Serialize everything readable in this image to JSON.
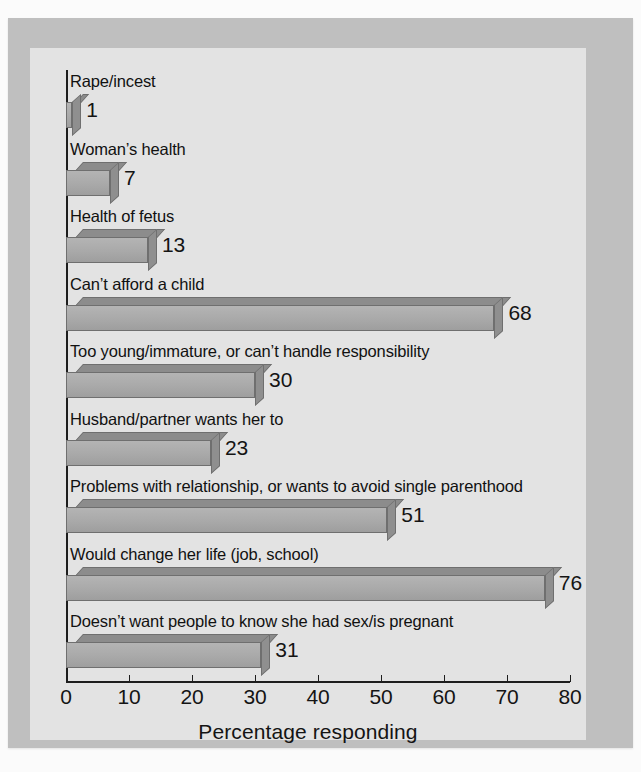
{
  "chart_data": {
    "type": "bar",
    "orientation": "horizontal",
    "title": "",
    "xlabel": "Percentage responding",
    "ylabel": "",
    "xlim": [
      0,
      80
    ],
    "xticks": [
      0,
      10,
      20,
      30,
      40,
      50,
      60,
      70,
      80
    ],
    "grid": false,
    "legend": null,
    "categories": [
      "Rape/incest",
      "Woman’s health",
      "Health of fetus",
      "Can’t afford a child",
      "Too young/immature, or can’t handle responsibility",
      "Husband/partner wants her to",
      "Problems with relationship, or wants to avoid single parenthood",
      "Would change her life (job, school)",
      "Doesn’t want people to know she had sex/is pregnant"
    ],
    "values": [
      1,
      7,
      13,
      68,
      30,
      23,
      51,
      76,
      31
    ],
    "data_labels": [
      "1",
      "7",
      "13",
      "68",
      "30",
      "23",
      "51",
      "76",
      "31"
    ]
  },
  "style": {
    "bar_face_color": "#a9a9a9",
    "bar_top_color": "#8c8c8c",
    "bar_edge_color": "#6f6f6f",
    "axis_color": "#1d1d1d",
    "panel_color": "#e3e3e3",
    "frame_color": "#bfbfbf",
    "text_color": "#141414"
  }
}
